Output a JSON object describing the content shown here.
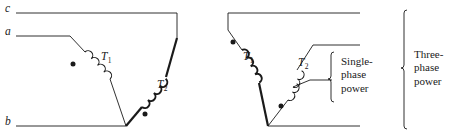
{
  "figure": {
    "line_color": "#1a1a1a",
    "thin_stroke": 0.9,
    "thick_stroke": 2.2,
    "diagrams": [
      {
        "name": "open-delta-left",
        "terminals": [
          {
            "id": "c",
            "label": "c"
          },
          {
            "id": "a",
            "label": "a"
          },
          {
            "id": "b",
            "label": "b"
          }
        ],
        "transformers": [
          {
            "id": "T1",
            "label": "T",
            "subscript": "1",
            "winding": "thin"
          },
          {
            "id": "T2",
            "label": "T",
            "subscript": "2",
            "winding": "thick"
          }
        ],
        "polarity_dots": 2
      },
      {
        "name": "open-delta-right",
        "transformers": [
          {
            "id": "T1",
            "label": "T",
            "subscript": "1",
            "winding": "thick"
          },
          {
            "id": "T2",
            "label": "T",
            "subscript": "2",
            "winding": "thin"
          }
        ],
        "polarity_dots": 2,
        "center_tap": true
      }
    ],
    "brackets": [
      {
        "name": "single-phase-bracket",
        "lines": [
          "Single-",
          "phase",
          "power"
        ]
      },
      {
        "name": "three-phase-bracket",
        "lines": [
          "Three-",
          "phase",
          "power"
        ]
      }
    ]
  }
}
